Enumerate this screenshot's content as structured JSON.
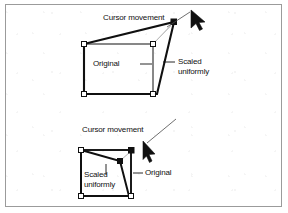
{
  "figure": {
    "background_color": "#ffffff",
    "border_color": "#9b9b9b",
    "ink_color": "#101010"
  },
  "panels": [
    {
      "id": "scale-up",
      "description": "Dragging the top-right corner handle outward scales the object up uniformly",
      "labels": {
        "cursor_movement": "Cursor movement",
        "original": "Original",
        "scaled_line1": "Scaled",
        "scaled_line2": "uniformly",
        "original_dash": "—",
        "scaled_dash": "—"
      },
      "original_shape": {
        "type": "rectangle",
        "points": [
          [
            84,
            44
          ],
          [
            153,
            44
          ],
          [
            153,
            94
          ],
          [
            84,
            94
          ]
        ],
        "stroke": "#101010",
        "fill": "#ffffff"
      },
      "scaled_shape": {
        "type": "quadrilateral",
        "points": [
          [
            84,
            44
          ],
          [
            174,
            22
          ],
          [
            157,
            94
          ],
          [
            84,
            94
          ]
        ],
        "stroke": "#101010",
        "fill": "none"
      },
      "handles": [
        {
          "name": "handle-top-left",
          "x": 84,
          "y": 44,
          "state": "hollow"
        },
        {
          "name": "handle-top-right",
          "x": 153,
          "y": 44,
          "state": "hollow"
        },
        {
          "name": "handle-bottom-right",
          "x": 153,
          "y": 94,
          "state": "hollow"
        },
        {
          "name": "handle-bottom-left",
          "x": 84,
          "y": 94,
          "state": "hollow"
        },
        {
          "name": "handle-dragged",
          "x": 174,
          "y": 22,
          "state": "filled"
        }
      ],
      "cursor": {
        "x": 192,
        "y": 16,
        "direction": "up-left"
      },
      "leader_lines": [
        {
          "name": "cursor-leader",
          "from": [
            167,
            26
          ],
          "to": [
            189,
            13
          ]
        }
      ]
    },
    {
      "id": "scale-down",
      "description": "Dragging the top-right corner handle inward scales the object down uniformly",
      "labels": {
        "cursor_movement": "Cursor movement",
        "original": "Original",
        "scaled_line1": "Scaled",
        "scaled_line2": "uniformly",
        "original_dash": "—",
        "scaled_tick": "|"
      },
      "original_shape": {
        "type": "rectangle",
        "points": [
          [
            81,
            150
          ],
          [
            131,
            150
          ],
          [
            131,
            196
          ],
          [
            81,
            196
          ]
        ],
        "stroke": "#101010",
        "fill": "#ffffff"
      },
      "scaled_shape": {
        "type": "quadrilateral",
        "points": [
          [
            81,
            150
          ],
          [
            120,
            161
          ],
          [
            129,
            196
          ],
          [
            81,
            196
          ]
        ],
        "stroke": "#101010",
        "fill": "none"
      },
      "handles": [
        {
          "name": "handle-top-left",
          "x": 81,
          "y": 150,
          "state": "hollow"
        },
        {
          "name": "handle-top-right",
          "x": 131,
          "y": 150,
          "state": "filled"
        },
        {
          "name": "handle-bottom-right",
          "x": 131,
          "y": 196,
          "state": "hollow"
        },
        {
          "name": "handle-bottom-left",
          "x": 81,
          "y": 196,
          "state": "hollow"
        },
        {
          "name": "handle-dragged",
          "x": 120,
          "y": 161,
          "state": "filled"
        }
      ],
      "cursor": {
        "x": 146,
        "y": 146,
        "direction": "down-left"
      },
      "leader_lines": [
        {
          "name": "cursor-leader",
          "from": [
            173,
            122
          ],
          "to": [
            146,
            144
          ]
        },
        {
          "name": "scaled-tick-leader",
          "from": [
            106,
            166
          ],
          "to": [
            106,
            176
          ]
        },
        {
          "name": "handle-leader",
          "from": [
            127,
            153
          ],
          "to": [
            121,
            160
          ]
        }
      ]
    }
  ]
}
